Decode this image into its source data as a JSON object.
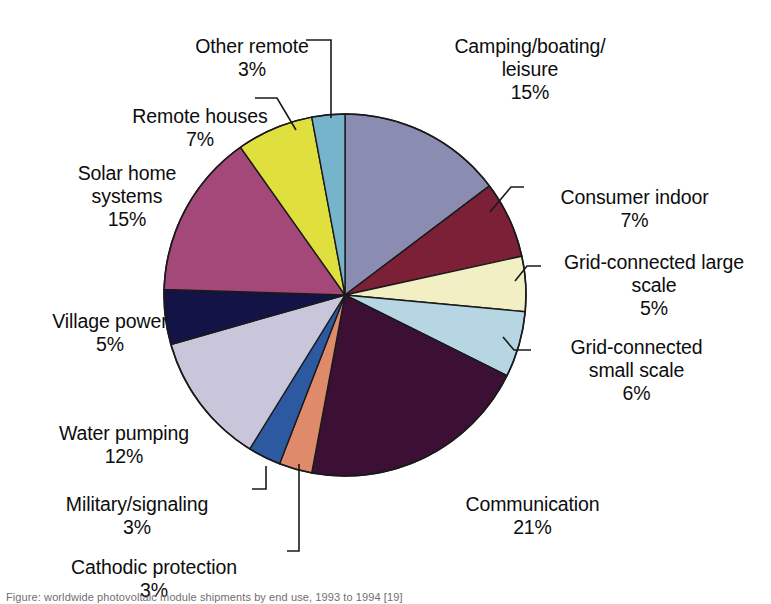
{
  "chart_data": {
    "type": "pie",
    "title": "",
    "subtitle": "",
    "xlabel": "",
    "ylabel": "",
    "units": "percent",
    "legend_position": "callout-labels",
    "grid": false,
    "total": 102,
    "categories": [
      "Camping/boating/\nleisure",
      "Consumer indoor",
      "Grid-connected large\nscale",
      "Grid-connected\nsmall scale",
      "Communication",
      "Cathodic protection",
      "Military/signaling",
      "Water pumping",
      "Village power",
      "Solar home\nsystems",
      "Remote houses",
      "Other remote"
    ],
    "values": [
      15,
      7,
      5,
      6,
      21,
      3,
      3,
      12,
      5,
      15,
      7,
      3
    ],
    "value_labels": [
      "15%",
      "7%",
      "5%",
      "6%",
      "21%",
      "3%",
      "3%",
      "12%",
      "5%",
      "15%",
      "7%",
      "3%"
    ],
    "colors": [
      "#8a8cb2",
      "#7c2038",
      "#f1efc3",
      "#b7d6e3",
      "#3c1034",
      "#e08a6c",
      "#2d59a0",
      "#c9c6db",
      "#131345",
      "#a34878",
      "#dfe03d",
      "#76b4cc"
    ],
    "slice_edge_color": "#1a1a1a",
    "start_angle_deg": 0,
    "direction": "clockwise"
  },
  "labels": {
    "other_remote": {
      "name": "Other remote",
      "value": "3%"
    },
    "remote_houses": {
      "name": "Remote houses",
      "value": "7%"
    },
    "solar_home": {
      "name": "Solar home\nsystems",
      "value": "15%"
    },
    "village_power": {
      "name": "Village power",
      "value": "5%"
    },
    "water_pumping": {
      "name": "Water pumping",
      "value": "12%"
    },
    "military": {
      "name": "Military/signaling",
      "value": "3%"
    },
    "cathodic": {
      "name": "Cathodic protection",
      "value": "3%"
    },
    "camping": {
      "name": "Camping/boating/\nleisure",
      "value": "15%"
    },
    "consumer": {
      "name": "Consumer indoor",
      "value": "7%"
    },
    "grid_large": {
      "name": "Grid-connected large\nscale",
      "value": "5%"
    },
    "grid_small": {
      "name": "Grid-connected\nsmall scale",
      "value": "6%"
    },
    "communication": {
      "name": "Communication",
      "value": "21%"
    }
  },
  "caption": {
    "text": "Figure: worldwide photovoltaic module shipments by end use, 1993 to 1994 [19]"
  }
}
